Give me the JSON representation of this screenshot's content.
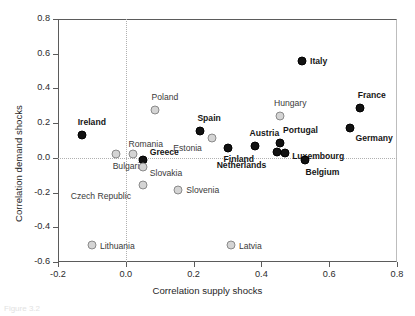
{
  "figure": {
    "caption": "Figure 3.2"
  },
  "chart_data": {
    "type": "scatter",
    "title": "",
    "xlabel": "Correlation supply shocks",
    "ylabel": "Correlation demand shocks",
    "xlim": [
      -0.2,
      0.8
    ],
    "ylim": [
      -0.6,
      0.8
    ],
    "xticks": [
      "-0.2",
      "0.0",
      "0.2",
      "0.4",
      "0.6",
      "0.8"
    ],
    "xtick_values": [
      -0.2,
      0.0,
      0.2,
      0.4,
      0.6,
      0.8
    ],
    "yticks": [
      "0.8",
      "0.6",
      "0.4",
      "0.2",
      "0.0",
      "-0.2",
      "-0.4",
      "-0.6"
    ],
    "ytick_values": [
      0.8,
      0.6,
      0.4,
      0.2,
      0.0,
      -0.2,
      -0.4,
      -0.6
    ],
    "grid": "zero-reference-lines-only",
    "legend": "none",
    "series": [
      {
        "name": "Euro area members",
        "marker": "filled-black-circle",
        "color": "#121212",
        "points": [
          {
            "label": "Ireland",
            "x": -0.13,
            "y": 0.13,
            "label_dx": -4,
            "label_dy": -13,
            "label_align": "left"
          },
          {
            "label": "Greece",
            "x": 0.05,
            "y": -0.01,
            "label_dx": 7,
            "label_dy": -8,
            "label_align": "left"
          },
          {
            "label": "Spain",
            "x": 0.22,
            "y": 0.155,
            "label_dx": -3,
            "label_dy": -13,
            "label_align": "left"
          },
          {
            "label": "Finland",
            "x": 0.3,
            "y": 0.055,
            "label_dx": -4,
            "label_dy": 11,
            "label_align": "left"
          },
          {
            "label": "Austria",
            "x": 0.38,
            "y": 0.07,
            "label_dx": -5,
            "label_dy": -13,
            "label_align": "left"
          },
          {
            "label": "Netherlands",
            "x": 0.445,
            "y": 0.035,
            "label_dx": -20,
            "label_dy": 13,
            "label_align": "left"
          },
          {
            "label": "Portugal",
            "x": 0.455,
            "y": 0.085,
            "label_dx": 3,
            "label_dy": -13,
            "label_align": "left"
          },
          {
            "label": "Luxembourg",
            "x": 0.47,
            "y": 0.03,
            "label_dx": 7,
            "label_dy": 3,
            "label_align": "left"
          },
          {
            "label": "Belgium",
            "x": 0.53,
            "y": -0.01,
            "label_dx": 0,
            "label_dy": 12,
            "label_align": "left"
          },
          {
            "label": "Italy",
            "x": 0.52,
            "y": 0.56,
            "label_dx": 8,
            "label_dy": 0,
            "label_align": "left"
          },
          {
            "label": "Germany",
            "x": 0.66,
            "y": 0.17,
            "label_dx": 6,
            "label_dy": 10,
            "label_align": "left"
          },
          {
            "label": "France",
            "x": 0.69,
            "y": 0.29,
            "label_dx": -2,
            "label_dy": -13,
            "label_align": "left"
          }
        ]
      },
      {
        "name": "Non-euro area EU members",
        "marker": "open-grey-circle",
        "color": "#d4d4d4",
        "points": [
          {
            "label": "Bulgaria",
            "x": -0.03,
            "y": 0.025,
            "label_dx": -3,
            "label_dy": 12,
            "label_align": "left"
          },
          {
            "label": "Romania",
            "x": 0.02,
            "y": 0.025,
            "label_dx": -4,
            "label_dy": -10,
            "label_align": "left"
          },
          {
            "label": "Slovakia",
            "x": 0.05,
            "y": -0.055,
            "label_dx": 7,
            "label_dy": 6,
            "label_align": "left"
          },
          {
            "label": "Czech Republic",
            "x": 0.05,
            "y": -0.155,
            "label_dx": -22,
            "label_dy": 11,
            "label_align": "left"
          },
          {
            "label": "Poland",
            "x": 0.085,
            "y": 0.275,
            "label_dx": -3,
            "label_dy": -13,
            "label_align": "left"
          },
          {
            "label": "Slovenia",
            "x": 0.155,
            "y": -0.185,
            "label_dx": 8,
            "label_dy": 0,
            "label_align": "left"
          },
          {
            "label": "Estonia",
            "x": 0.255,
            "y": 0.115,
            "label_dx": -20,
            "label_dy": 10,
            "label_align": "left"
          },
          {
            "label": "Hungary",
            "x": 0.455,
            "y": 0.24,
            "label_dx": -6,
            "label_dy": -13,
            "label_align": "left"
          },
          {
            "label": "Lithuania",
            "x": -0.1,
            "y": -0.5,
            "label_dx": 8,
            "label_dy": 1,
            "label_align": "left"
          },
          {
            "label": "Latvia",
            "x": 0.31,
            "y": -0.5,
            "label_dx": 8,
            "label_dy": 1,
            "label_align": "left"
          }
        ]
      }
    ]
  }
}
